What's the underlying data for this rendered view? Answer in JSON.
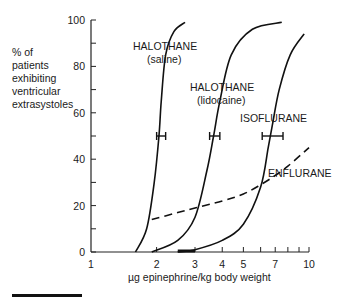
{
  "chart_data": {
    "type": "line",
    "title": "",
    "xlabel": "µg epinephrine/kg body weight",
    "ylabel": "% of patients exhibiting ventricular extrasystoles",
    "ylabel_lines": [
      "% of",
      "patients",
      "exhibiting",
      "ventricular",
      "extrasystoles"
    ],
    "x_scale": "log",
    "xlim": [
      1,
      10
    ],
    "ylim": [
      0,
      100
    ],
    "x_ticks": [
      1,
      2,
      3,
      4,
      5,
      7,
      10
    ],
    "x_tick_labels": [
      "1",
      "2",
      "3",
      "4",
      "5",
      "7",
      "10"
    ],
    "y_ticks": [
      0,
      20,
      40,
      60,
      80,
      100
    ],
    "y_tick_labels": [
      "0",
      "20",
      "40",
      "60",
      "80",
      "100"
    ],
    "grid": false,
    "legend": "inline labels",
    "series": [
      {
        "name": "HALOTHANE (saline)",
        "label_lines": [
          "HALOTHANE",
          "(saline)"
        ],
        "style": "solid",
        "x": [
          1.6,
          1.8,
          1.95,
          2.05,
          2.1,
          2.2,
          2.4,
          2.7
        ],
        "y": [
          0,
          10,
          30,
          50,
          65,
          85,
          95,
          99
        ],
        "ed50": 2.1,
        "ed50_error": [
          2.0,
          2.2
        ]
      },
      {
        "name": "HALOTHANE (lidocaine)",
        "label_lines": [
          "HALOTHANE",
          "(lidocaine)"
        ],
        "style": "solid",
        "x": [
          1.9,
          2.5,
          3.0,
          3.4,
          3.65,
          3.9,
          4.4,
          5.5,
          7.5
        ],
        "y": [
          0,
          5,
          15,
          35,
          50,
          65,
          85,
          96,
          99
        ],
        "ed50": 3.7,
        "ed50_error": [
          3.5,
          3.9
        ]
      },
      {
        "name": "ISOFLURANE",
        "label_lines": [
          "ISOFLURANE"
        ],
        "style": "solid",
        "x": [
          2.5,
          3.0,
          4.0,
          5.0,
          6.0,
          6.5,
          6.8,
          7.3,
          8.2,
          9.5
        ],
        "y": [
          0,
          1,
          5,
          12,
          28,
          45,
          55,
          70,
          85,
          94
        ],
        "ed50": 6.7,
        "ed50_error": [
          6.1,
          7.6
        ]
      },
      {
        "name": "ENFLURANE",
        "label_lines": [
          "ENFLURANE"
        ],
        "style": "dashed",
        "x": [
          1.9,
          2.5,
          3.0,
          4.0,
          5.0,
          6.0,
          7.0,
          8.0,
          10.0
        ],
        "y": [
          14,
          17,
          19,
          22,
          25,
          29,
          33,
          37,
          45
        ]
      }
    ],
    "annotations": [
      "ED50 error bars at 50% for halothane (saline), halothane (lidocaine), isoflurane",
      "Thick bar on x-axis between ~2.5 and ~3"
    ]
  }
}
